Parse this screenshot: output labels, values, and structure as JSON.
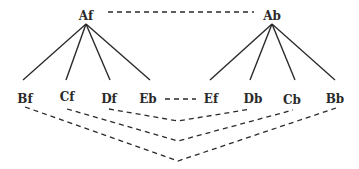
{
  "diagram": {
    "roots": [
      {
        "id": "Af",
        "label": "Af",
        "x": 86,
        "y": 20
      },
      {
        "id": "Ab",
        "label": "Ab",
        "x": 272,
        "y": 20
      }
    ],
    "leaves": [
      {
        "id": "Bf",
        "label": "Bf",
        "x": 25,
        "y": 103,
        "parent": "Af",
        "edge_end_x": 23
      },
      {
        "id": "Cf",
        "label": "Cf",
        "x": 67,
        "y": 101,
        "parent": "Af",
        "edge_end_x": 66
      },
      {
        "id": "Df",
        "label": "Df",
        "x": 109,
        "y": 103,
        "parent": "Af",
        "edge_end_x": 110
      },
      {
        "id": "Eb",
        "label": "Eb",
        "x": 148,
        "y": 103,
        "parent": "Af",
        "edge_end_x": 150
      },
      {
        "id": "Ef",
        "label": "Ef",
        "x": 211,
        "y": 103,
        "parent": "Ab",
        "edge_end_x": 210
      },
      {
        "id": "Db",
        "label": "Db",
        "x": 253,
        "y": 103,
        "parent": "Ab",
        "edge_end_x": 250
      },
      {
        "id": "Cb",
        "label": "Cb",
        "x": 292,
        "y": 104,
        "parent": "Ab",
        "edge_end_x": 295
      },
      {
        "id": "Bb",
        "label": "Bb",
        "x": 335,
        "y": 103,
        "parent": "Ab",
        "edge_end_x": 335
      }
    ],
    "dashed_links": [
      {
        "from": "Af",
        "to": "Ab",
        "type": "straight"
      },
      {
        "from": "Eb",
        "to": "Ef",
        "type": "straight"
      },
      {
        "from": "Df",
        "to": "Db",
        "type": "v",
        "vertex_y": 121
      },
      {
        "from": "Cf",
        "to": "Cb",
        "type": "v",
        "vertex_y": 141
      },
      {
        "from": "Bf",
        "to": "Bb",
        "type": "v",
        "vertex_y": 161
      }
    ]
  }
}
